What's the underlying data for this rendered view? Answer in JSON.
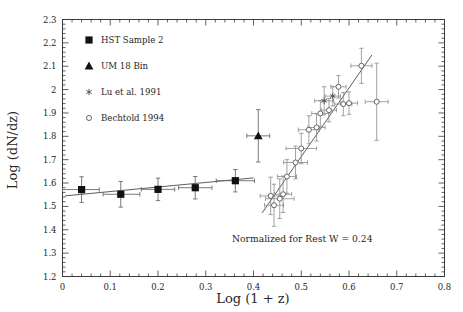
{
  "chart_data": {
    "type": "scatter",
    "title": "",
    "xlabel": "Log (1 + z)",
    "ylabel": "Log (dN/dz)",
    "xlim": [
      0.0,
      0.8
    ],
    "ylim": [
      1.2,
      2.3
    ],
    "xticks": [
      "0",
      "0.1",
      "0.2",
      "0.3",
      "0.4",
      "0.5",
      "0.6",
      "0.7",
      "0.8"
    ],
    "xtick_values": [
      0,
      0.1,
      0.2,
      0.3,
      0.4,
      0.5,
      0.6,
      0.7,
      0.8
    ],
    "yticks": [
      "1.2",
      "1.3",
      "1.4",
      "1.5",
      "1.6",
      "1.7",
      "1.8",
      "1.9",
      "2",
      "2.1",
      "2.2",
      "2.3"
    ],
    "ytick_values": [
      1.2,
      1.3,
      1.4,
      1.5,
      1.6,
      1.7,
      1.8,
      1.9,
      2.0,
      2.1,
      2.2,
      2.3
    ],
    "grid": false,
    "legend_position": "top-left",
    "annotation": "Normalized for Rest W = 0.24",
    "series": [
      {
        "name": "HST Sample 2",
        "marker": "filled-square",
        "points": [
          {
            "x": 0.04,
            "y": 1.572,
            "xerr_lo": 0.04,
            "xerr_hi": 0.037,
            "yerr": 0.055
          },
          {
            "x": 0.122,
            "y": 1.552,
            "xerr_lo": 0.037,
            "xerr_hi": 0.04,
            "yerr": 0.055
          },
          {
            "x": 0.2,
            "y": 1.573,
            "xerr_lo": 0.035,
            "xerr_hi": 0.035,
            "yerr": 0.048
          },
          {
            "x": 0.278,
            "y": 1.58,
            "xerr_lo": 0.035,
            "xerr_hi": 0.035,
            "yerr": 0.048
          },
          {
            "x": 0.362,
            "y": 1.61,
            "xerr_lo": 0.04,
            "xerr_hi": 0.04,
            "yerr": 0.048
          }
        ]
      },
      {
        "name": "UM 18 Bin",
        "marker": "filled-triangle",
        "points": [
          {
            "x": 0.41,
            "y": 1.802,
            "xerr_lo": 0.024,
            "xerr_hi": 0.024,
            "yerr": 0.112
          }
        ]
      },
      {
        "name": "Lu et al. 1991",
        "marker": "asterisk",
        "points": [
          {
            "x": 0.548,
            "y": 1.952,
            "xerr_lo": 0.02,
            "xerr_hi": 0.02,
            "yerr": 0.06
          },
          {
            "x": 0.566,
            "y": 1.972,
            "xerr_lo": 0.016,
            "xerr_hi": 0.016,
            "yerr": 0.042
          }
        ]
      },
      {
        "name": "Bechtold 1994",
        "marker": "open-circle",
        "points": [
          {
            "x": 0.436,
            "y": 1.545,
            "xerr_lo": 0.022,
            "xerr_hi": 0.022,
            "yerr": 0.08
          },
          {
            "x": 0.443,
            "y": 1.505,
            "xerr_lo": 0.02,
            "xerr_hi": 0.02,
            "yerr": 0.09
          },
          {
            "x": 0.455,
            "y": 1.533,
            "xerr_lo": 0.03,
            "xerr_hi": 0.03,
            "yerr": 0.085
          },
          {
            "x": 0.462,
            "y": 1.552,
            "xerr_lo": 0.018,
            "xerr_hi": 0.018,
            "yerr": 0.078
          },
          {
            "x": 0.47,
            "y": 1.628,
            "xerr_lo": 0.02,
            "xerr_hi": 0.02,
            "yerr": 0.072
          },
          {
            "x": 0.488,
            "y": 1.688,
            "xerr_lo": 0.025,
            "xerr_hi": 0.025,
            "yerr": 0.07
          },
          {
            "x": 0.5,
            "y": 1.748,
            "xerr_lo": 0.032,
            "xerr_hi": 0.032,
            "yerr": 0.065
          },
          {
            "x": 0.516,
            "y": 1.828,
            "xerr_lo": 0.022,
            "xerr_hi": 0.022,
            "yerr": 0.06
          },
          {
            "x": 0.532,
            "y": 1.838,
            "xerr_lo": 0.018,
            "xerr_hi": 0.018,
            "yerr": 0.058
          },
          {
            "x": 0.54,
            "y": 1.898,
            "xerr_lo": 0.018,
            "xerr_hi": 0.018,
            "yerr": 0.055
          },
          {
            "x": 0.558,
            "y": 1.912,
            "xerr_lo": 0.016,
            "xerr_hi": 0.016,
            "yerr": 0.05
          },
          {
            "x": 0.578,
            "y": 2.012,
            "xerr_lo": 0.016,
            "xerr_hi": 0.016,
            "yerr": 0.048
          },
          {
            "x": 0.588,
            "y": 1.938,
            "xerr_lo": 0.018,
            "xerr_hi": 0.018,
            "yerr": 0.05
          },
          {
            "x": 0.6,
            "y": 1.942,
            "xerr_lo": 0.018,
            "xerr_hi": 0.018,
            "yerr": 0.048
          },
          {
            "x": 0.626,
            "y": 2.102,
            "xerr_lo": 0.022,
            "xerr_hi": 0.022,
            "yerr": 0.075
          },
          {
            "x": 0.658,
            "y": 1.948,
            "xerr_lo": 0.024,
            "xerr_hi": 0.024,
            "yerr": 0.165
          }
        ]
      }
    ],
    "fit_lines": [
      {
        "name": "low-z-fit",
        "x0": 0.005,
        "y0": 1.545,
        "x1": 0.4,
        "y1": 1.622
      },
      {
        "name": "high-z-fit",
        "x0": 0.418,
        "y0": 1.472,
        "x1": 0.648,
        "y1": 2.148
      }
    ]
  },
  "legend": {
    "items": [
      {
        "label": "HST Sample 2",
        "marker": "filled-square"
      },
      {
        "label": "UM 18 Bin",
        "marker": "filled-triangle"
      },
      {
        "label": "Lu et al. 1991",
        "marker": "asterisk"
      },
      {
        "label": "Bechtold 1994",
        "marker": "open-circle"
      }
    ]
  }
}
